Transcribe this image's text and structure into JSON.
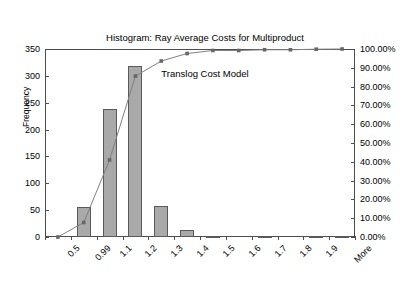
{
  "chart_data": {
    "type": "bar",
    "title": "Histogram: Ray Average Costs for Multiproduct Translog Cost Model",
    "title_lines": [
      "Histogram: Ray Average Costs for Multiproduct",
      "Translog Cost Model"
    ],
    "xlabel": "",
    "ylabel": "Frequency",
    "y2label": "",
    "categories": [
      "0.5",
      "0.99",
      "1.1",
      "1.2",
      "1.3",
      "1.4",
      "1.5",
      "1.6",
      "1.7",
      "1.8",
      "1.9",
      "More"
    ],
    "values": [
      0,
      55,
      238,
      318,
      57,
      13,
      1,
      0,
      1,
      0,
      1,
      1
    ],
    "ylim": [
      0,
      350
    ],
    "yticks": [
      0,
      50,
      100,
      150,
      200,
      250,
      300,
      350
    ],
    "ytick_labels": [
      "0",
      "50",
      "100",
      "150",
      "200",
      "250",
      "300",
      "350"
    ],
    "y2lim": [
      0,
      100
    ],
    "y2ticks": [
      0,
      10,
      20,
      30,
      40,
      50,
      60,
      70,
      80,
      90,
      100
    ],
    "y2tick_labels": [
      "0.00%",
      "10.00%",
      "20.00%",
      "30.00%",
      "40.00%",
      "50.00%",
      "60.00%",
      "70.00%",
      "80.00%",
      "90.00%",
      "100.00%"
    ],
    "series": [
      {
        "name": "Frequency",
        "kind": "bar",
        "axis": "left",
        "values": [
          0,
          55,
          238,
          318,
          57,
          13,
          1,
          0,
          1,
          0,
          1,
          1
        ]
      },
      {
        "name": "Cumulative %",
        "kind": "line",
        "axis": "right",
        "values": [
          0.0,
          7.7,
          41.0,
          85.6,
          93.6,
          97.6,
          99.2,
          99.2,
          99.6,
          99.6,
          99.9,
          100.0
        ]
      }
    ],
    "grid": false,
    "legend": "none",
    "colors": {
      "bar_fill": "#a9a9a9",
      "bar_stroke": "#5a5a5a",
      "line": "#808080",
      "marker": "#666666",
      "axis": "#4d4d4d",
      "text": "#000000",
      "background": "#ffffff"
    }
  }
}
